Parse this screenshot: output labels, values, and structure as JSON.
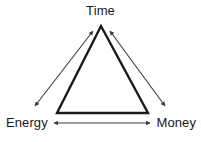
{
  "diagram": {
    "type": "triangle-tradeoff",
    "title_visible": false,
    "background_color": "#ffffff",
    "stroke_color": "#1a1a1a",
    "arrow_color": "#3a3a3a",
    "nodes": [
      {
        "id": "time",
        "label": "Time",
        "position": "apex"
      },
      {
        "id": "energy",
        "label": "Energy",
        "position": "bottom-left"
      },
      {
        "id": "money",
        "label": "Money",
        "position": "bottom-right"
      }
    ],
    "edges": [
      {
        "id": "energy-time",
        "from": "Energy",
        "to": "Time",
        "arrow": "double"
      },
      {
        "id": "time-money",
        "from": "Time",
        "to": "Money",
        "arrow": "double"
      },
      {
        "id": "energy-money",
        "from": "Energy",
        "to": "Money",
        "arrow": "double"
      }
    ]
  }
}
